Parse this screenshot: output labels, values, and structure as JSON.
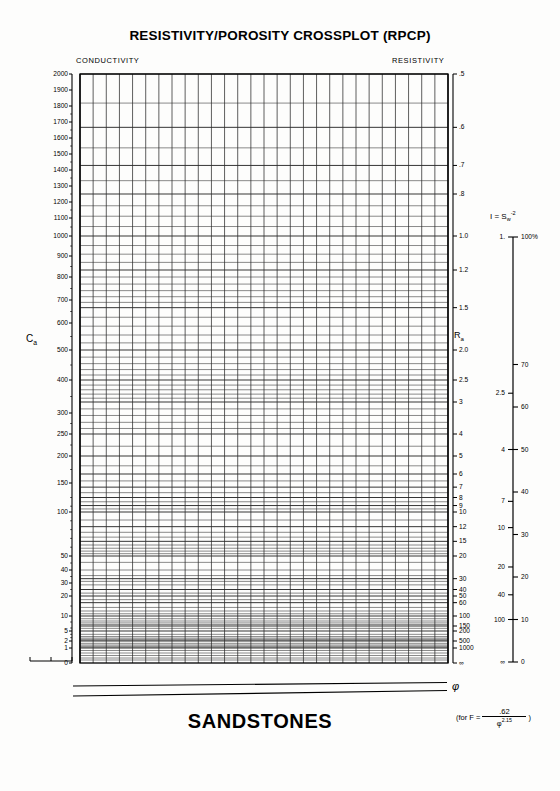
{
  "document": {
    "title": "RESISTIVITY/POROSITY CROSSPLOT (RPCP)",
    "footer_title": "SANDSTONES"
  },
  "colors": {
    "ink": "#000000",
    "grid": "#2a2a2a",
    "paper": "#fdfdfc"
  },
  "headers": {
    "left": "CONDUCTIVITY",
    "right": "RESISTIVITY"
  },
  "axes": {
    "conductivity": {
      "symbol": "C",
      "symbol_sub": "a",
      "name": "conductivity-axis",
      "ticks": [
        {
          "label": "2000",
          "value": 2000
        },
        {
          "label": "1900",
          "value": 1900
        },
        {
          "label": "1800",
          "value": 1800
        },
        {
          "label": "1700",
          "value": 1700
        },
        {
          "label": "1600",
          "value": 1600
        },
        {
          "label": "1500",
          "value": 1500
        },
        {
          "label": "1400",
          "value": 1400
        },
        {
          "label": "1300",
          "value": 1300
        },
        {
          "label": "1200",
          "value": 1200
        },
        {
          "label": "1100",
          "value": 1100
        },
        {
          "label": "1000",
          "value": 1000
        },
        {
          "label": "900",
          "value": 900
        },
        {
          "label": "800",
          "value": 800
        },
        {
          "label": "700",
          "value": 700
        },
        {
          "label": "600",
          "value": 600
        },
        {
          "label": "500",
          "value": 500
        },
        {
          "label": "400",
          "value": 400
        },
        {
          "label": "300",
          "value": 300
        },
        {
          "label": "250",
          "value": 250
        },
        {
          "label": "200",
          "value": 200
        },
        {
          "label": "150",
          "value": 150
        },
        {
          "label": "100",
          "value": 100
        },
        {
          "label": "50",
          "value": 50
        },
        {
          "label": "40",
          "value": 40
        },
        {
          "label": "30",
          "value": 30
        },
        {
          "label": "20",
          "value": 20
        },
        {
          "label": "10",
          "value": 10
        },
        {
          "label": "5",
          "value": 5
        },
        {
          "label": "2",
          "value": 2
        },
        {
          "label": "1",
          "value": 1
        },
        {
          "label": "0",
          "value": 0
        }
      ]
    },
    "resistivity": {
      "symbol": "R",
      "symbol_sub": "a",
      "name": "resistivity-axis",
      "ticks": [
        {
          "label": ".5",
          "value": 0.5
        },
        {
          "label": ".6",
          "value": 0.6
        },
        {
          "label": ".7",
          "value": 0.7
        },
        {
          "label": ".8",
          "value": 0.8
        },
        {
          "label": "1.0",
          "value": 1.0
        },
        {
          "label": "1.2",
          "value": 1.2
        },
        {
          "label": "1.5",
          "value": 1.5
        },
        {
          "label": "2.0",
          "value": 2.0
        },
        {
          "label": "2.5",
          "value": 2.5
        },
        {
          "label": "3",
          "value": 3
        },
        {
          "label": "4",
          "value": 4
        },
        {
          "label": "5",
          "value": 5
        },
        {
          "label": "6",
          "value": 6
        },
        {
          "label": "7",
          "value": 7
        },
        {
          "label": "8",
          "value": 8
        },
        {
          "label": "9",
          "value": 9
        },
        {
          "label": "10",
          "value": 10
        },
        {
          "label": "12",
          "value": 12
        },
        {
          "label": "15",
          "value": 15
        },
        {
          "label": "20",
          "value": 20
        },
        {
          "label": "30",
          "value": 30
        },
        {
          "label": "40",
          "value": 40
        },
        {
          "label": "50",
          "value": 50
        },
        {
          "label": "60",
          "value": 60
        },
        {
          "label": "100",
          "value": 100
        },
        {
          "label": "150",
          "value": 150
        },
        {
          "label": "200",
          "value": 200
        },
        {
          "label": "500",
          "value": 500
        },
        {
          "label": "1000",
          "value": 1000
        },
        {
          "label": "∞",
          "value": null
        }
      ]
    },
    "resistivity_index": {
      "title_prefix": "I = S",
      "title_sub": "w",
      "title_sup": "-2",
      "name": "resistivity-index-scale",
      "left_ticks": [
        {
          "label": "1.",
          "value": 1
        },
        {
          "label": "2.5",
          "value": 2.5
        },
        {
          "label": "4",
          "value": 4
        },
        {
          "label": "7",
          "value": 7
        },
        {
          "label": "10",
          "value": 10
        },
        {
          "label": "20",
          "value": 20
        },
        {
          "label": "40",
          "value": 40
        },
        {
          "label": "100",
          "value": 100
        },
        {
          "label": "∞",
          "value": null
        }
      ],
      "right_ticks": [
        {
          "label": "100%",
          "value": 100
        },
        {
          "label": "70",
          "value": 70
        },
        {
          "label": "60",
          "value": 60
        },
        {
          "label": "50",
          "value": 50
        },
        {
          "label": "40",
          "value": 40
        },
        {
          "label": "30",
          "value": 30
        },
        {
          "label": "20",
          "value": 20
        },
        {
          "label": "10",
          "value": 10
        },
        {
          "label": "0",
          "value": 0
        }
      ]
    }
  },
  "porosity": {
    "symbol": "φ",
    "formula_prefix": "(for F =",
    "formula_numerator": ".62",
    "formula_denominator_symbol": "φ",
    "formula_denominator_exponent": "2.15",
    "formula_suffix": ")"
  },
  "chart_data": {
    "type": "line",
    "title": "RESISTIVITY/POROSITY CROSSPLOT (RPCP)",
    "subtitle": "SANDSTONES",
    "xlabel": "",
    "ylabel": "",
    "grid": true,
    "legend": "none",
    "y_left_axis": {
      "name": "Ca",
      "tick_labels": [
        "2000",
        "1900",
        "1800",
        "1700",
        "1600",
        "1500",
        "1400",
        "1300",
        "1200",
        "1100",
        "1000",
        "900",
        "800",
        "700",
        "600",
        "500",
        "400",
        "300",
        "250",
        "200",
        "150",
        "100",
        "50",
        "40",
        "30",
        "20",
        "10",
        "5",
        "2",
        "1",
        "0"
      ],
      "tick_values": [
        2000,
        1900,
        1800,
        1700,
        1600,
        1500,
        1400,
        1300,
        1200,
        1100,
        1000,
        900,
        800,
        700,
        600,
        500,
        400,
        300,
        250,
        200,
        150,
        100,
        50,
        40,
        30,
        20,
        10,
        5,
        2,
        1,
        0
      ],
      "ylim": [
        0,
        2000
      ],
      "scale": "reciprocal"
    },
    "y_right_axis": {
      "name": "Ra",
      "tick_labels": [
        ".5",
        ".6",
        ".7",
        ".8",
        "1.0",
        "1.2",
        "1.5",
        "2.0",
        "2.5",
        "3",
        "4",
        "5",
        "6",
        "7",
        "8",
        "9",
        "10",
        "12",
        "15",
        "20",
        "30",
        "40",
        "50",
        "60",
        "100",
        "150",
        "200",
        "500",
        "1000",
        "∞"
      ],
      "tick_values": [
        0.5,
        0.6,
        0.7,
        0.8,
        1.0,
        1.2,
        1.5,
        2.0,
        2.5,
        3,
        4,
        5,
        6,
        7,
        8,
        9,
        10,
        12,
        15,
        20,
        30,
        40,
        50,
        60,
        100,
        150,
        200,
        500,
        1000,
        null
      ],
      "relation": "Ra = 1000 / Ca"
    },
    "x_axis": {
      "name": "phi",
      "gridline_count": 28,
      "spacing": "uniform"
    },
    "index_axis": {
      "name": "I = Sw^-2",
      "index_values": [
        1,
        2.5,
        4,
        7,
        10,
        20,
        40,
        100,
        null
      ],
      "index_labels": [
        "1.",
        "2.5",
        "4",
        "7",
        "10",
        "20",
        "40",
        "100",
        "∞"
      ],
      "saturation_labels": [
        "100%",
        "70",
        "60",
        "50",
        "40",
        "30",
        "20",
        "10",
        "0"
      ],
      "saturation_values": [
        100,
        70,
        60,
        50,
        40,
        30,
        20,
        10,
        0
      ],
      "relation": "Sw = I^-0.5"
    },
    "series": []
  }
}
